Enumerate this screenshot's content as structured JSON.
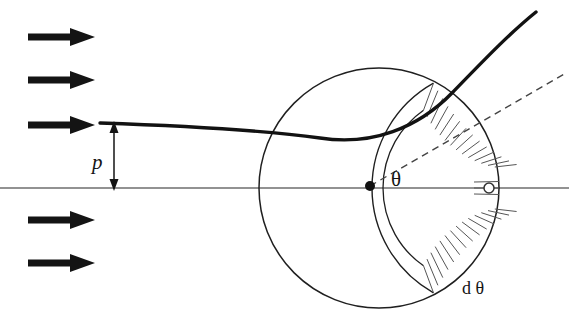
{
  "figure": {
    "kind": "scattering-cross-section-diagram",
    "width": 569,
    "height": 333,
    "background_color": "#ffffff"
  },
  "labels": {
    "impact_parameter": "p",
    "scattering_angle": "θ",
    "angle_element": "d θ"
  },
  "colors": {
    "ink": "#141414",
    "axis_gray": "#6e6e6e",
    "thin_line": "#333333",
    "hatch": "#555555",
    "dashed": "#444444"
  },
  "geometry": {
    "axis_y": 188,
    "axis_x_start": 0,
    "axis_x_end": 569,
    "circle_center_x": 379,
    "circle_center_y": 188,
    "circle_radius": 120,
    "scatter_center_dot_x": 370,
    "scatter_center_dot_y": 186,
    "scatter_center_dot_radius": 5,
    "target_marker_x": 489,
    "target_marker_y": 188,
    "target_marker_radius": 5,
    "incoming_beam_y": 124,
    "impact_arrow_x": 114,
    "impact_arrow_top_y": 124,
    "impact_arrow_bottom_y": 188,
    "asymptote_angle_deg": 30,
    "detector_inner_radius": 95,
    "detector_outer_radius": 120,
    "detector_half_span_deg": 55,
    "hatch_count": 26
  },
  "beam_arrows": {
    "x_start": 28,
    "x_tip": 95,
    "shaft_thickness": 7,
    "head_length": 22,
    "head_half_height": 9,
    "rows_y": [
      37,
      80,
      125,
      220,
      263
    ]
  },
  "trajectory": {
    "description": "hyperbolic particle path deflected by the scattering center",
    "path": "M 100 123 C 190 126, 268 131, 320 138 C 372 146, 418 128, 452 93 C 486 58, 510 33, 536 12"
  }
}
